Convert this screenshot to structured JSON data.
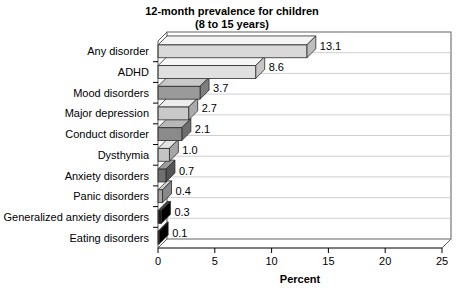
{
  "chart_data": {
    "type": "bar",
    "orientation": "horizontal",
    "title": "12-month prevalence for children",
    "subtitle": "(8 to 15 years)",
    "xlabel": "Percent",
    "ylabel": "",
    "xlim": [
      0,
      25
    ],
    "xticks": [
      "0",
      "5",
      "10",
      "15",
      "20",
      "25"
    ],
    "xtick_values": [
      0,
      5,
      10,
      15,
      20,
      25
    ],
    "grid": true,
    "legend": "none",
    "style": "3d-horizontal-bars",
    "categories": [
      "Any disorder",
      "ADHD",
      "Mood disorders",
      "Major depression",
      "Conduct disorder",
      "Dysthymia",
      "Anxiety disorders",
      "Panic disorders",
      "Generalized anxiety disorders",
      "Eating disorders"
    ],
    "values": [
      13.1,
      8.6,
      3.7,
      2.7,
      2.1,
      1.0,
      0.7,
      0.4,
      0.3,
      0.1
    ],
    "value_labels": [
      "13.1",
      "8.6",
      "3.7",
      "2.7",
      "2.1",
      "1.0",
      "0.7",
      "0.4",
      "0.3",
      "0.1"
    ],
    "bar_colors": [
      "#d9d9d9",
      "#e0e0e0",
      "#9a9a9a",
      "#c9c9c9",
      "#8a8a8a",
      "#c4c4c4",
      "#6f6f6f",
      "#a5a5a5",
      "#1a1a1a",
      "#111111"
    ],
    "bar_top_colors": [
      "#f4f4f4",
      "#f6f6f6",
      "#c8c8c8",
      "#ececec",
      "#b8b8b8",
      "#e4e4e4",
      "#9c9c9c",
      "#cfcfcf",
      "#444444",
      "#3a3a3a"
    ],
    "bar_side_colors": [
      "#bdbdbd",
      "#c6c6c6",
      "#7d7d7d",
      "#ababab",
      "#6e6e6e",
      "#a6a6a6",
      "#545454",
      "#888888",
      "#000000",
      "#000000"
    ]
  }
}
